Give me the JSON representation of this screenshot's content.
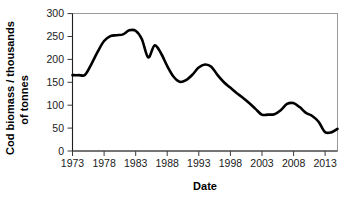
{
  "figure": {
    "background_color": "#ffffff",
    "line_color": "#000000",
    "frame_color": "#9a9a9a"
  },
  "axes": {
    "y_title_line1": "Cod biomass / thousands",
    "y_title_line2": "of tonnes",
    "x_title": "Date",
    "y_ticks": [
      "0",
      "50",
      "100",
      "150",
      "200",
      "250",
      "300"
    ],
    "x_ticks": [
      "1973",
      "1978",
      "1983",
      "1988",
      "1993",
      "1998",
      "2003",
      "2008",
      "2013"
    ]
  },
  "chart_data": {
    "type": "line",
    "title": "",
    "xlabel": "Date",
    "ylabel": "Cod biomass / thousands of tonnes",
    "xlim": [
      1973,
      2015
    ],
    "ylim": [
      0,
      310
    ],
    "yticks": [
      0,
      50,
      100,
      150,
      200,
      250,
      300
    ],
    "xticks": [
      1973,
      1978,
      1983,
      1988,
      1993,
      1998,
      2003,
      2008,
      2013
    ],
    "grid": false,
    "legend": null,
    "series": [
      {
        "name": "Cod biomass",
        "x": [
          1973,
          1974,
          1975,
          1976,
          1977,
          1978,
          1979,
          1980,
          1981,
          1982,
          1983,
          1984,
          1985,
          1986,
          1987,
          1988,
          1989,
          1990,
          1991,
          1992,
          1993,
          1994,
          1995,
          1996,
          1997,
          1998,
          1999,
          2000,
          2001,
          2002,
          2003,
          2004,
          2005,
          2006,
          2007,
          2008,
          2009,
          2010,
          2011,
          2012,
          2013,
          2014,
          2015
        ],
        "values": [
          171,
          171,
          172,
          196,
          224,
          248,
          259,
          261,
          263,
          272,
          271,
          252,
          211,
          238,
          221,
          192,
          168,
          156,
          160,
          172,
          188,
          195,
          190,
          171,
          155,
          143,
          131,
          120,
          108,
          95,
          82,
          82,
          83,
          92,
          106,
          108,
          99,
          86,
          79,
          66,
          43,
          42,
          50
        ]
      }
    ]
  }
}
